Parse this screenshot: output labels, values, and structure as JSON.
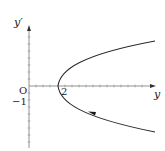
{
  "diagram": {
    "type": "phase-plane",
    "axes": {
      "horizontal_label": "y",
      "vertical_label": "y′",
      "origin_label": "O"
    },
    "tick_labels": {
      "x_two": "2",
      "y_minus_one": "−1"
    },
    "curve": {
      "shape": "parabola opening rightward",
      "vertex": [
        2,
        0
      ],
      "direction": "arrow on lower branch pointing toward vertex (leftward)"
    },
    "colors": {
      "curve": "#2a2a2a",
      "axis": "#555555",
      "grid_ticks": "#9a9a9a"
    }
  }
}
